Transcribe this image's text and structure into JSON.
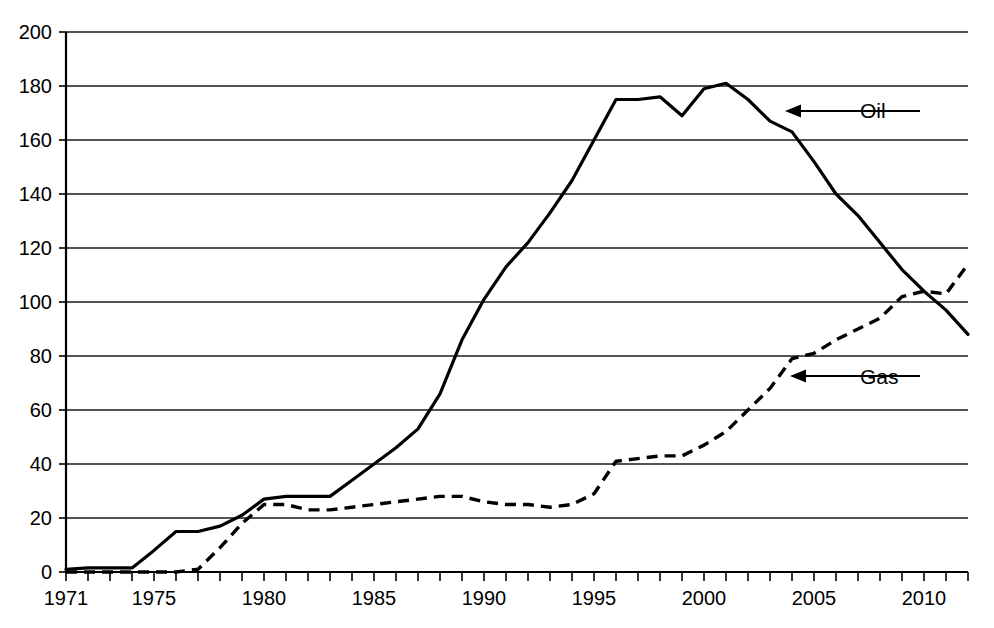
{
  "chart_data": {
    "type": "line",
    "title": "",
    "subtitle": "",
    "xlabel": "",
    "ylabel": "",
    "xlim": [
      1971,
      2012
    ],
    "ylim": [
      0,
      200
    ],
    "ytick_step": 20,
    "yticks": [
      0,
      20,
      40,
      60,
      80,
      100,
      120,
      140,
      160,
      180,
      200
    ],
    "ytick_labels": [
      "0",
      "20",
      "40",
      "60",
      "80",
      "100",
      "120",
      "140",
      "160",
      "180",
      "200"
    ],
    "xticks": [
      1971,
      1972,
      1973,
      1974,
      1975,
      1976,
      1977,
      1978,
      1979,
      1980,
      1981,
      1982,
      1983,
      1984,
      1985,
      1986,
      1987,
      1988,
      1989,
      1990,
      1991,
      1992,
      1993,
      1994,
      1995,
      1996,
      1997,
      1998,
      1999,
      2000,
      2001,
      2002,
      2003,
      2004,
      2005,
      2006,
      2007,
      2008,
      2009,
      2010,
      2011,
      2012
    ],
    "xtick_labels_shown": [
      "1971",
      "1975",
      "1980",
      "1985",
      "1990",
      "1995",
      "2000",
      "2005",
      "2010"
    ],
    "xtick_label_values": [
      1971,
      1975,
      1980,
      1985,
      1990,
      1995,
      2000,
      2005,
      2010
    ],
    "grid": "horizontal",
    "legend_position": "inline-annotations",
    "x": [
      1971,
      1972,
      1973,
      1974,
      1975,
      1976,
      1977,
      1978,
      1979,
      1980,
      1981,
      1982,
      1983,
      1984,
      1985,
      1986,
      1987,
      1988,
      1989,
      1990,
      1991,
      1992,
      1993,
      1994,
      1995,
      1996,
      1997,
      1998,
      1999,
      2000,
      2001,
      2002,
      2003,
      2004,
      2005,
      2006,
      2007,
      2008,
      2009,
      2010,
      2011,
      2012
    ],
    "series": [
      {
        "name": "Oil",
        "style": "solid",
        "color": "#000000",
        "values": [
          1,
          1.5,
          1.5,
          1.5,
          8,
          15,
          15,
          17,
          21,
          27,
          28,
          28,
          28,
          34,
          40,
          46,
          53,
          66,
          86,
          101,
          113,
          122,
          133,
          145,
          160,
          175,
          175,
          176,
          169,
          179,
          181,
          175,
          167,
          163,
          152,
          140,
          132,
          122,
          112,
          104,
          97,
          88
        ]
      },
      {
        "name": "Gas",
        "style": "dashed",
        "color": "#000000",
        "values": [
          0,
          0,
          0,
          0,
          0,
          0,
          1,
          9,
          18,
          25,
          25,
          23,
          23,
          24,
          25,
          26,
          27,
          28,
          28,
          26,
          25,
          25,
          24,
          25,
          29,
          41,
          42,
          43,
          43,
          47,
          52,
          60,
          68,
          79,
          81,
          86,
          90,
          94,
          102,
          104,
          103,
          114
        ]
      }
    ],
    "annotations": [
      {
        "label": "Oil",
        "target_year": 2003,
        "target_value": 167,
        "text_x": 860,
        "text_y": 118,
        "arrow_from_x": 920,
        "arrow_to_x": 785,
        "arrow_y": 111
      },
      {
        "label": "Gas",
        "target_year": 2006,
        "target_value": 88,
        "text_x": 860,
        "text_y": 384,
        "arrow_from_x": 920,
        "arrow_to_x": 790,
        "arrow_y": 376
      }
    ]
  },
  "geometry": {
    "plot_left": 66,
    "plot_right": 968,
    "plot_top": 32,
    "plot_bottom": 572
  }
}
